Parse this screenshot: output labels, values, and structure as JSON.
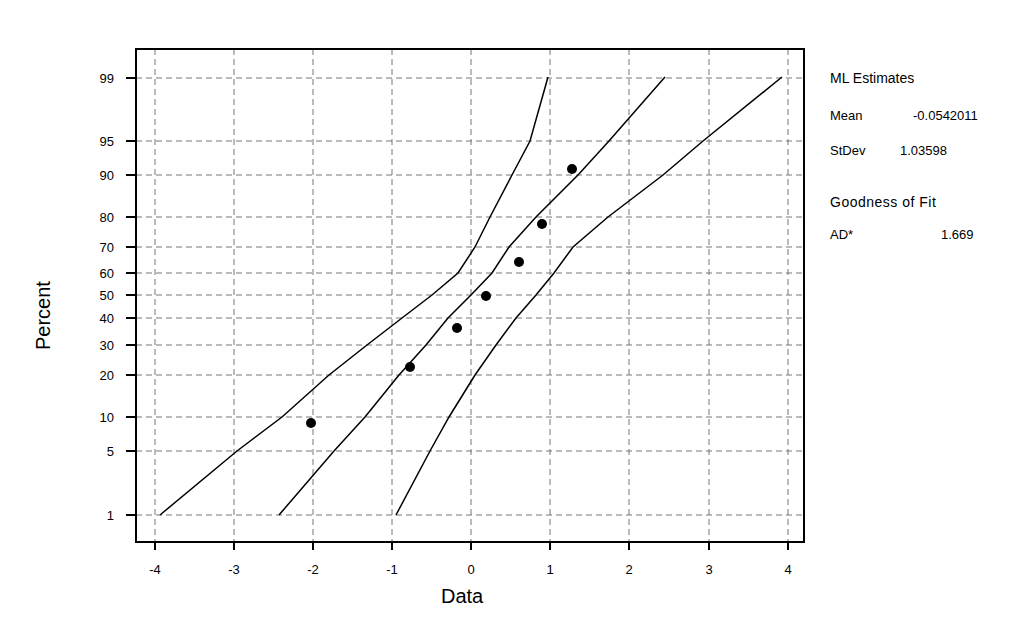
{
  "chart_data": {
    "type": "scatter",
    "title": "",
    "subtitle": "Normal probability plot with 95% confidence bands",
    "xlabel": "Data",
    "ylabel": "Percent",
    "xlim": [
      -4.2,
      4.2
    ],
    "x_ticks": [
      -4,
      -3,
      -2,
      -1,
      0,
      1,
      2,
      3,
      4
    ],
    "y_ticks": [
      1,
      5,
      10,
      20,
      30,
      40,
      50,
      60,
      70,
      80,
      90,
      95,
      99
    ],
    "y_scale": "normal-probability",
    "grid": true,
    "series": [
      {
        "name": "Data points",
        "kind": "scatter",
        "points": [
          [
            -2.07,
            9
          ],
          [
            -0.78,
            22
          ],
          [
            -0.18,
            36
          ],
          [
            0.19,
            50
          ],
          [
            0.61,
            64
          ],
          [
            0.9,
            78
          ],
          [
            1.28,
            91
          ]
        ]
      },
      {
        "name": "Fitted line",
        "kind": "line",
        "points": [
          [
            -2.45,
            1
          ],
          [
            -1.76,
            5
          ],
          [
            -1.38,
            10
          ],
          [
            -0.93,
            20
          ],
          [
            -0.6,
            30
          ],
          [
            -0.32,
            40
          ],
          [
            -0.05,
            50
          ],
          [
            0.21,
            60
          ],
          [
            0.49,
            70
          ],
          [
            0.82,
            80
          ],
          [
            1.27,
            90
          ],
          [
            1.65,
            95
          ],
          [
            2.37,
            99
          ]
        ]
      },
      {
        "name": "Lower CI",
        "kind": "line",
        "points": [
          [
            -3.95,
            1
          ],
          [
            -3.0,
            5
          ],
          [
            -2.45,
            10
          ],
          [
            -1.8,
            20
          ],
          [
            -1.32,
            30
          ],
          [
            -0.88,
            40
          ],
          [
            -0.48,
            50
          ],
          [
            -0.15,
            60
          ],
          [
            0.1,
            70
          ],
          [
            0.35,
            80
          ],
          [
            0.7,
            90
          ],
          [
            0.95,
            95
          ],
          [
            0.97,
            99
          ]
        ]
      },
      {
        "name": "Upper CI",
        "kind": "line",
        "points": [
          [
            -0.95,
            1
          ],
          [
            -0.52,
            5
          ],
          [
            -0.27,
            10
          ],
          [
            0.05,
            20
          ],
          [
            0.3,
            30
          ],
          [
            0.55,
            40
          ],
          [
            0.8,
            50
          ],
          [
            1.03,
            60
          ],
          [
            1.23,
            70
          ],
          [
            1.63,
            80
          ],
          [
            2.42,
            90
          ],
          [
            2.94,
            95
          ],
          [
            3.93,
            99
          ]
        ]
      }
    ],
    "annotations": {
      "ml_estimates_title": "ML Estimates",
      "mean_label": "Mean",
      "mean_value": "-0.0542011",
      "stdev_label": "StDev",
      "stdev_value": "1.03598",
      "gof_title": "Goodness of Fit",
      "ad_label": "AD*",
      "ad_value": "1.669"
    },
    "legend_position": "right"
  },
  "layout": {
    "plot": {
      "left": 136,
      "top": 49,
      "right": 804,
      "bottom": 542
    },
    "x_px": {
      "-4": 155,
      "-3": 234,
      "-2": 313,
      "-1": 392,
      "0": 471,
      "1": 550,
      "2": 629,
      "3": 709,
      "4": 788
    },
    "y_px": {
      "99": 78,
      "95": 141,
      "90": 175,
      "80": 217,
      "70": 247,
      "60": 273,
      "50": 295,
      "40": 318,
      "30": 345,
      "20": 375,
      "10": 417,
      "5": 451,
      "1": 515
    },
    "points_px": [
      [
        311,
        423
      ],
      [
        410,
        367
      ],
      [
        457,
        328
      ],
      [
        486,
        296
      ],
      [
        519,
        262
      ],
      [
        542,
        224
      ],
      [
        572,
        169
      ]
    ],
    "fit_line_px": [
      [
        279,
        515
      ],
      [
        334,
        451
      ],
      [
        365,
        417
      ],
      [
        399,
        375
      ],
      [
        426,
        345
      ],
      [
        448,
        318
      ],
      [
        471,
        295
      ],
      [
        492,
        273
      ],
      [
        509,
        247
      ],
      [
        536,
        217
      ],
      [
        578,
        175
      ],
      [
        609,
        141
      ],
      [
        665,
        77
      ]
    ],
    "lower_band_px": [
      [
        160,
        515
      ],
      [
        237,
        451
      ],
      [
        282,
        417
      ],
      [
        329,
        375
      ],
      [
        367,
        345
      ],
      [
        402,
        318
      ],
      [
        432,
        295
      ],
      [
        458,
        273
      ],
      [
        475,
        247
      ],
      [
        490,
        217
      ],
      [
        512,
        175
      ],
      [
        530,
        141
      ],
      [
        548,
        77
      ]
    ],
    "upper_band_px": [
      [
        396,
        515
      ],
      [
        430,
        451
      ],
      [
        449,
        417
      ],
      [
        475,
        375
      ],
      [
        496,
        345
      ],
      [
        516,
        318
      ],
      [
        536,
        295
      ],
      [
        554,
        273
      ],
      [
        573,
        247
      ],
      [
        608,
        217
      ],
      [
        663,
        175
      ],
      [
        703,
        141
      ],
      [
        782,
        77
      ]
    ]
  }
}
